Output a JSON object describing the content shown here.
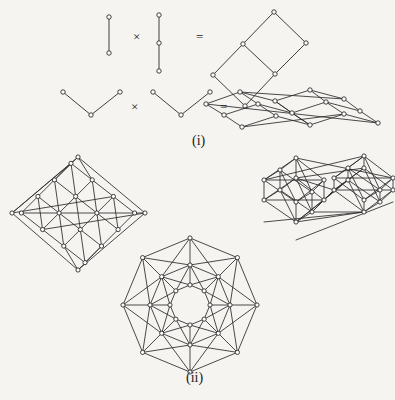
{
  "figure": {
    "background_color": "#f6f4f1",
    "ink_color": "#2b2b2b",
    "node_fill": "#ffffff",
    "parts": [
      {
        "id": "part-i",
        "label": "(i)"
      },
      {
        "id": "part-ii",
        "label": "(ii)"
      }
    ],
    "operators": {
      "times": "×",
      "equals": "="
    },
    "equations": [
      {
        "id": "equation-k2-times-p3",
        "left_factor": "path-2-vertices",
        "right_factor": "path-3-vertices",
        "result": "grid-2-by-3"
      },
      {
        "id": "equation-p3-times-p3",
        "left_factor": "path-3-vertices-v-shape",
        "right_factor": "path-3-vertices-v-shape",
        "result": "grid-3-by-3-folded"
      }
    ],
    "graphs": [
      {
        "id": "hypercube-q4",
        "caption_part": "(ii)",
        "position": "left"
      },
      {
        "id": "prism-octahedra",
        "caption_part": "(ii)",
        "position": "right"
      },
      {
        "id": "circulant-octagon-3-rings",
        "caption_part": "(ii)",
        "position": "bottom-center"
      }
    ]
  },
  "chart_data": {
    "type": "diagram",
    "title": "",
    "graph_diagrams": [
      {
        "name": "path-2-vertices",
        "role": "factor",
        "nodes": [
          [
            108,
            16
          ],
          [
            108,
            52
          ]
        ],
        "edges": [
          [
            0,
            1
          ]
        ]
      },
      {
        "name": "path-3-vertices",
        "role": "factor",
        "nodes": [
          [
            158,
            15
          ],
          [
            158,
            42
          ],
          [
            158,
            70
          ]
        ],
        "edges": [
          [
            0,
            1
          ],
          [
            1,
            2
          ]
        ]
      },
      {
        "name": "grid-2-by-3",
        "role": "product",
        "nodes": [
          [
            274,
            12
          ],
          [
            243,
            44
          ],
          [
            305,
            43
          ],
          [
            213,
            74
          ],
          [
            275,
            73
          ],
          [
            244,
            105
          ]
        ],
        "edges": [
          [
            0,
            1
          ],
          [
            0,
            2
          ],
          [
            1,
            3
          ],
          [
            1,
            4
          ],
          [
            2,
            4
          ],
          [
            3,
            5
          ],
          [
            4,
            5
          ]
        ]
      },
      {
        "name": "path-3-vertices-v-shape-left",
        "role": "factor",
        "nodes": [
          [
            62,
            92
          ],
          [
            90,
            114
          ],
          [
            119,
            92
          ]
        ],
        "edges": [
          [
            0,
            1
          ],
          [
            1,
            2
          ]
        ]
      },
      {
        "name": "path-3-vertices-v-shape-right",
        "role": "factor",
        "nodes": [
          [
            152,
            92
          ],
          [
            180,
            114
          ],
          [
            209,
            92
          ]
        ],
        "edges": [
          [
            0,
            1
          ],
          [
            1,
            2
          ]
        ]
      },
      {
        "name": "grid-3-by-3-folded",
        "role": "product",
        "nodes": [
          [
            243,
            92
          ],
          [
            276,
            100
          ],
          [
            310,
            92
          ],
          [
            255,
            110
          ],
          [
            288,
            118
          ],
          [
            322,
            110
          ],
          [
            268,
            128
          ],
          [
            300,
            118
          ],
          [
            334,
            92
          ],
          [
            226,
            110
          ],
          [
            240,
            123
          ],
          [
            206,
            103
          ]
        ],
        "edges": []
      },
      {
        "name": "hypercube-q4",
        "role": "graph",
        "outer_nodes": [
          [
            78,
            158
          ],
          [
            12,
            212
          ],
          [
            78,
            268
          ],
          [
            144,
            212
          ]
        ],
        "inner_ring_1": [
          [
            44,
            196
          ],
          [
            78,
            180
          ],
          [
            112,
            196
          ],
          [
            78,
            228
          ]
        ],
        "description": "4-dimensional hypercube drawn as nested diamonds"
      },
      {
        "name": "prism-octahedra",
        "role": "graph",
        "description": "two octahedra joined by prism edges"
      },
      {
        "name": "circulant-octagon-3-rings",
        "role": "graph",
        "rings": 3,
        "vertices_per_ring": 8,
        "description": "three concentric octagonal rings with radial and crossing edges"
      }
    ]
  }
}
